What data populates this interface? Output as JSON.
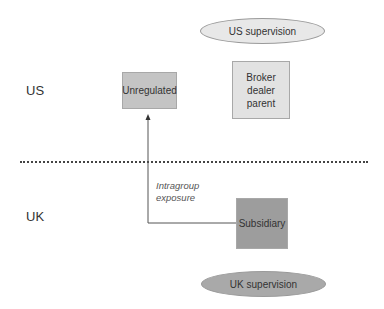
{
  "diagram": {
    "regions": {
      "us_label": "US",
      "uk_label": "UK"
    },
    "supervision": {
      "us": "US supervision",
      "uk": "UK supervision"
    },
    "entities": {
      "unregulated": "Unregulated",
      "broker_dealer_parent": "Broker dealer parent",
      "subsidiary": "Subsidiary"
    },
    "connector": {
      "label_line1": "Intragroup",
      "label_line2": "exposure",
      "from": "Subsidiary",
      "to": "Unregulated"
    },
    "colors": {
      "us_supervision_fill": "#e8e8e8",
      "uk_supervision_fill": "#a9a9a9",
      "unregulated_fill": "#c4c4c4",
      "broker_fill": "#e2e2e2",
      "subsidiary_fill": "#9d9d9d",
      "divider": "#444444",
      "line": "#555555"
    }
  }
}
